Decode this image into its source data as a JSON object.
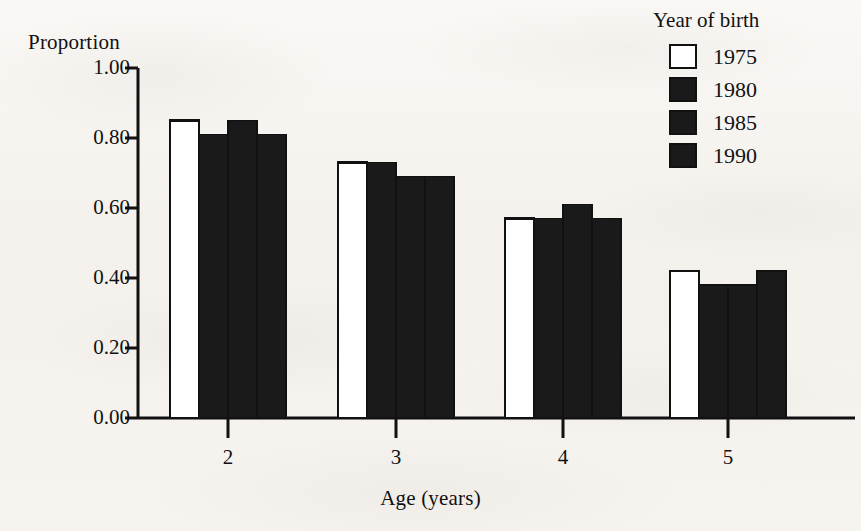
{
  "chart_data": {
    "type": "bar",
    "title": "",
    "xlabel": "Age (years)",
    "ylabel": "Proportion",
    "categories": [
      "2",
      "3",
      "4",
      "5"
    ],
    "ylim": [
      0.0,
      1.0
    ],
    "ytick_labels": [
      "1.00",
      "0.80",
      "0.60",
      "0.40",
      "0.20",
      "0.00"
    ],
    "ytick_values": [
      1.0,
      0.8,
      0.6,
      0.4,
      0.2,
      0.0
    ],
    "xtick_labels": [
      "2",
      "3",
      "4",
      "5"
    ],
    "grid": false,
    "legend_position": "top-right",
    "legend_title": "Year of birth",
    "series": [
      {
        "name": "1975",
        "fill": "open",
        "color": "#ffffff",
        "values": [
          0.85,
          0.73,
          0.57,
          0.42
        ]
      },
      {
        "name": "1980",
        "fill": "filled",
        "color": "#1a1a1a",
        "values": [
          0.81,
          0.73,
          0.57,
          0.38
        ]
      },
      {
        "name": "1985",
        "fill": "filled",
        "color": "#1a1a1a",
        "values": [
          0.85,
          0.69,
          0.61,
          0.38
        ]
      },
      {
        "name": "1990",
        "fill": "filled",
        "color": "#1a1a1a",
        "values": [
          0.81,
          0.69,
          0.57,
          0.42
        ]
      }
    ]
  },
  "axes": {
    "y_title": "Proportion",
    "x_title": "Age (years)"
  },
  "legend": {
    "title": "Year of birth",
    "items": [
      {
        "label": "1975",
        "fill": "open"
      },
      {
        "label": "1980",
        "fill": "filled"
      },
      {
        "label": "1985",
        "fill": "filled"
      },
      {
        "label": "1990",
        "fill": "filled"
      }
    ]
  },
  "colors": {
    "ink": "#111111",
    "bar_fill": "#1a1a1a",
    "bar_open": "#ffffff",
    "paper": "#f7f5f2"
  }
}
